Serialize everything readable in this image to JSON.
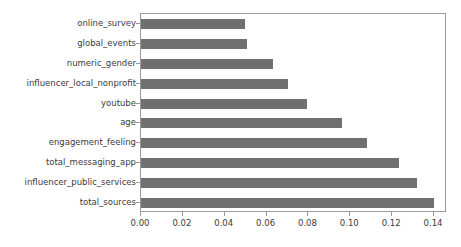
{
  "chart_data": {
    "type": "bar",
    "orientation": "horizontal",
    "title": "",
    "xlabel": "",
    "ylabel": "",
    "xlim": [
      0.0,
      0.1462
    ],
    "xticks": [
      0.0,
      0.02,
      0.04,
      0.06,
      0.08,
      0.1,
      0.12,
      0.14
    ],
    "xtick_labels": [
      "0.00",
      "0.02",
      "0.04",
      "0.06",
      "0.08",
      "0.10",
      "0.12",
      "0.14"
    ],
    "grid": false,
    "legend": null,
    "bar_color": "#707070",
    "frame_color": "#9a9a9a",
    "categories": [
      "online_survey",
      "global_events",
      "numeric_gender",
      "influencer_local_nonprofit",
      "youtube",
      "age",
      "engagement_feeling",
      "total_messaging_app",
      "influencer_public_services",
      "total_sources"
    ],
    "values": [
      0.0495,
      0.0505,
      0.063,
      0.07,
      0.0795,
      0.096,
      0.108,
      0.1235,
      0.132,
      0.14
    ]
  }
}
